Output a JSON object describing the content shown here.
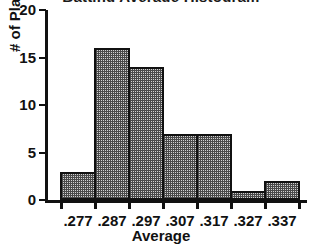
{
  "chart_data": {
    "type": "bar",
    "title": "",
    "xlabel": "Average",
    "ylabel": "# of Players",
    "categories": [
      ".277",
      ".287",
      ".297",
      ".307",
      ".317",
      ".327",
      ".337"
    ],
    "values": [
      3,
      16,
      14,
      7,
      7,
      1,
      2
    ],
    "ylim": [
      0,
      20
    ],
    "yticks": [
      0,
      5,
      10,
      15,
      20
    ],
    "ytick_labels": [
      "0",
      "5",
      "10",
      "15",
      "20"
    ],
    "grid": false,
    "legend": false,
    "bin_edges": [
      ".272",
      ".282",
      ".292",
      ".302",
      ".312",
      ".322",
      ".332",
      ".342"
    ],
    "bar_fill_color": "#d2d2d2",
    "bar_edge_color": "#111111",
    "axis_color": "#111111",
    "background_color": "#ffffff"
  },
  "title_remnant": "Batting Average Histogram"
}
